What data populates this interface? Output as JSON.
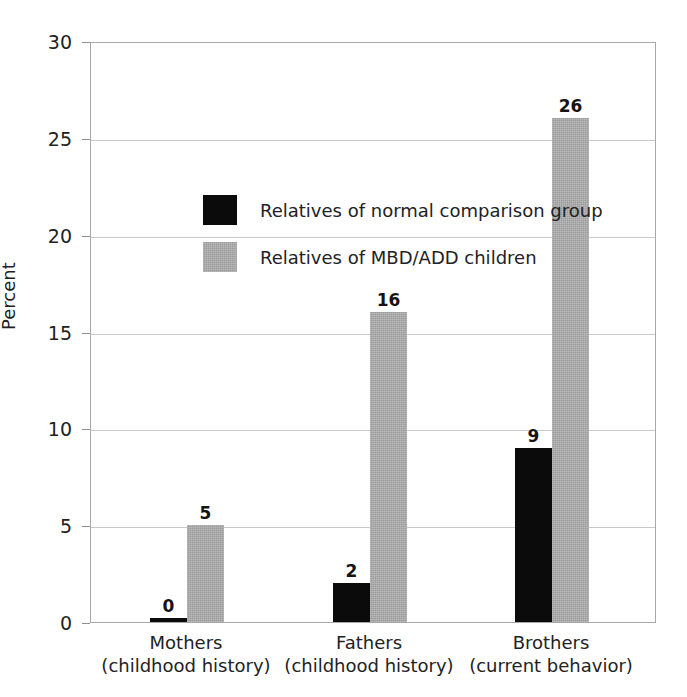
{
  "figure": {
    "clipped_top_text": "",
    "background": "#ffffff"
  },
  "chart_data": {
    "type": "bar",
    "title": "",
    "xlabel": "",
    "ylabel": "Percent",
    "ylim": [
      0,
      30
    ],
    "yticks": [
      0,
      5,
      10,
      15,
      20,
      25,
      30
    ],
    "ytick_labels": [
      "0",
      "5",
      "10",
      "15",
      "20",
      "25",
      "30"
    ],
    "grid": true,
    "grid_axis": "y",
    "legend_position": "upper-left-inside",
    "categories": [
      "Mothers\n(childhood history)",
      "Fathers\n(childhood history)",
      "Brothers\n(current behavior)"
    ],
    "category_lines": [
      {
        "main": "Mothers",
        "sub": "(childhood history)"
      },
      {
        "main": "Fathers",
        "sub": "(childhood history)"
      },
      {
        "main": "Brothers",
        "sub": "(current behavior)"
      }
    ],
    "series": [
      {
        "name": "Relatives of normal comparison group",
        "color": "#0b0b0b",
        "values": [
          0,
          2,
          9
        ],
        "labels": [
          "0",
          "2",
          "9"
        ]
      },
      {
        "name": "Relatives of MBD/ADD children",
        "color": "#9b9b9b",
        "values": [
          5,
          16,
          26
        ],
        "labels": [
          "5",
          "16",
          "26"
        ]
      }
    ]
  },
  "legend": {
    "items": [
      {
        "label": "Relatives of normal comparison group",
        "swatch": "black"
      },
      {
        "label": "Relatives of MBD/ADD children",
        "swatch": "gray"
      }
    ]
  },
  "colors": {
    "black_series": "#0b0b0b",
    "gray_series": "#9b9b9b",
    "gridline": "#c9c9c9",
    "axis": "#a8a8a8",
    "text": "#222222"
  }
}
